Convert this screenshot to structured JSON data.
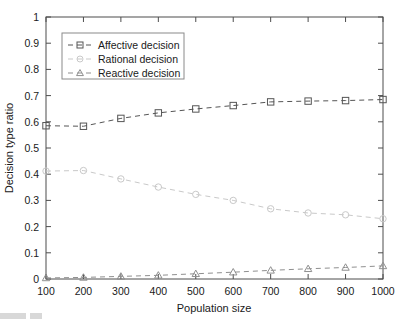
{
  "chart_data": {
    "type": "line",
    "title": "",
    "xlabel": "Population size",
    "ylabel": "Decision type ratio",
    "x": [
      100,
      200,
      300,
      400,
      500,
      600,
      700,
      800,
      900,
      1000
    ],
    "xlim": [
      100,
      1000
    ],
    "ylim": [
      0,
      1
    ],
    "xticks": [
      "100",
      "200",
      "300",
      "400",
      "500",
      "600",
      "700",
      "800",
      "900",
      "1000"
    ],
    "yticks": [
      "0",
      "0.1",
      "0.2",
      "0.3",
      "0.4",
      "0.5",
      "0.6",
      "0.7",
      "0.8",
      "0.9",
      "1"
    ],
    "grid": false,
    "legend_position": "upper-left-inside",
    "series": [
      {
        "name": "Affective decision",
        "marker": "square",
        "linestyle": "dashed",
        "color": "#555555",
        "values": [
          0.585,
          0.583,
          0.613,
          0.634,
          0.649,
          0.662,
          0.676,
          0.679,
          0.681,
          0.685
        ]
      },
      {
        "name": "Rational decision",
        "marker": "circle",
        "linestyle": "dashed",
        "color": "#c9c9c9",
        "values": [
          0.412,
          0.414,
          0.382,
          0.351,
          0.323,
          0.3,
          0.268,
          0.252,
          0.245,
          0.23
        ]
      },
      {
        "name": "Reactive decision",
        "marker": "triangle",
        "linestyle": "dashed",
        "color": "#8f8f8f",
        "values": [
          0.004,
          0.006,
          0.01,
          0.014,
          0.02,
          0.026,
          0.033,
          0.039,
          0.044,
          0.05
        ]
      }
    ]
  },
  "legend": {
    "items": [
      {
        "label": "Affective decision"
      },
      {
        "label": "Rational decision"
      },
      {
        "label": "Reactive decision"
      }
    ]
  },
  "axes": {
    "x_title": "Population size",
    "y_title": "Decision type ratio"
  }
}
